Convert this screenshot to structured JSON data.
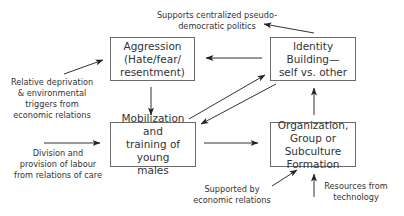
{
  "nodes": {
    "aggression": "Aggression\n(Hate/fear/\nresentment)",
    "identity": "Identity\nBuilding—\nself vs. other",
    "mobilization": "Mobilization and\ntraining of young\nmales",
    "organization": "Organization,\nGroup or Subculture\nFormation"
  },
  "labels": {
    "supports_politics": "Supports centralized pseudo-\ndemocratic politics",
    "relative_deprivation": "Relative deprivation\n& environmental\ntriggers from\neconomic relations",
    "division_labour": "Division and\nprovision of labour\nfrom relations of care",
    "supported_economic": "Supported by\neconomic relations",
    "resources_technology": "Resources from\ntechnology"
  },
  "edges": [
    {
      "from": "identity",
      "to": "supports_politics"
    },
    {
      "from": "identity",
      "to": "aggression"
    },
    {
      "from": "relative_deprivation",
      "to": "aggression"
    },
    {
      "from": "aggression",
      "to": "mobilization"
    },
    {
      "from": "mobilization",
      "to": "identity"
    },
    {
      "from": "identity",
      "to": "mobilization"
    },
    {
      "from": "division_labour",
      "to": "mobilization"
    },
    {
      "from": "mobilization",
      "to": "organization"
    },
    {
      "from": "organization",
      "to": "identity"
    },
    {
      "from": "supported_economic",
      "to": "organization"
    },
    {
      "from": "resources_technology",
      "to": "organization"
    }
  ]
}
